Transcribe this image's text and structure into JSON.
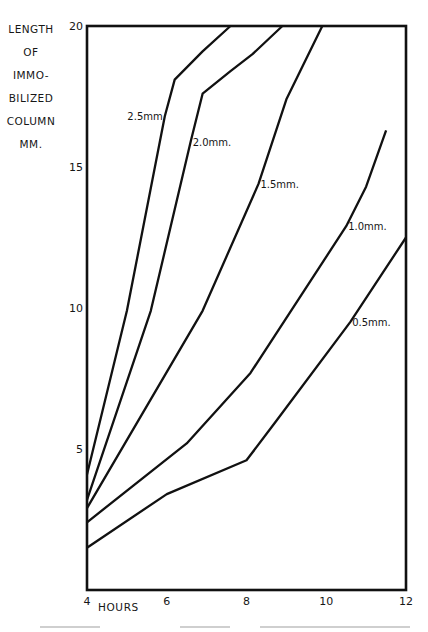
{
  "chart_data": {
    "type": "line",
    "title": "",
    "xlabel": "HOURS",
    "ylabel": "LENGTH OF IMMOBILIZED COLUMN MM.",
    "ylabel_lines": [
      "LENGTH",
      "OF",
      "IMMO-",
      "BILIZED",
      "COLUMN",
      "MM."
    ],
    "xlim": [
      4,
      12
    ],
    "ylim": [
      0,
      20
    ],
    "x_ticks": [
      4,
      6,
      8,
      10,
      12
    ],
    "y_ticks": [
      5,
      10,
      15,
      20
    ],
    "grid": false,
    "legend": "inline labels",
    "series": [
      {
        "name": "2.5 mm",
        "label": "2.5mm",
        "x": [
          4,
          5.0,
          5.95,
          6.2,
          6.9,
          7.6
        ],
        "y": [
          4.1,
          9.9,
          16.8,
          18.1,
          19.1,
          20
        ],
        "label_at": [
          5.95,
          16.8
        ],
        "label_side": "left"
      },
      {
        "name": "2.0 mm",
        "label": "2.0mm.",
        "x": [
          4,
          5.6,
          6.6,
          6.9,
          7.6,
          8.15,
          8.9
        ],
        "y": [
          3.2,
          9.9,
          15.9,
          17.6,
          18.4,
          19.0,
          20
        ],
        "label_at": [
          6.6,
          15.9
        ],
        "label_side": "right"
      },
      {
        "name": "1.5 mm",
        "label": "1.5mm.",
        "x": [
          4,
          6.9,
          8.3,
          9.0,
          9.9
        ],
        "y": [
          2.9,
          9.9,
          14.4,
          17.4,
          20
        ],
        "label_at": [
          8.3,
          14.4
        ],
        "label_side": "right"
      },
      {
        "name": "1.0 mm",
        "label": "1.0mm.",
        "x": [
          4,
          6.5,
          8.1,
          10.5,
          11.0,
          11.5
        ],
        "y": [
          2.4,
          5.2,
          7.7,
          12.9,
          14.3,
          16.3
        ],
        "label_at": [
          10.5,
          12.9
        ],
        "label_side": "right"
      },
      {
        "name": "0.5 mm",
        "label": "0.5mm.",
        "x": [
          4,
          6.0,
          8.0,
          8.75,
          10.6,
          12
        ],
        "y": [
          1.5,
          3.4,
          4.6,
          6.0,
          9.5,
          12.5
        ],
        "label_at": [
          10.6,
          9.5
        ],
        "label_side": "right"
      }
    ]
  },
  "colors": {
    "line": "#111111",
    "axis": "#111111",
    "text": "#161616",
    "background": "#ffffff"
  }
}
